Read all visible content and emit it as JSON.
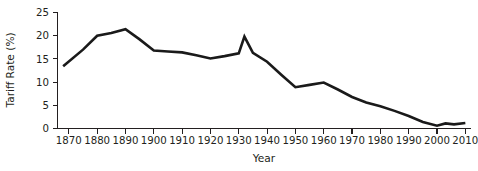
{
  "chart_data": {
    "type": "line",
    "title": "",
    "xlabel": "Year",
    "ylabel": "Tariff Rate (%)",
    "xlim": [
      1866,
      2012
    ],
    "ylim": [
      0,
      25
    ],
    "grid": false,
    "legend": false,
    "legend_position": "none",
    "line_color": "#1a1a1a",
    "line_width": 2.6,
    "x_tick_labels": [
      "1870",
      "1880",
      "1890",
      "1900",
      "1910",
      "1920",
      "1930",
      "1940",
      "1950",
      "1960",
      "1970",
      "1980",
      "1990",
      "2000",
      "2010"
    ],
    "x_ticks": [
      1870,
      1880,
      1890,
      1900,
      1910,
      1920,
      1930,
      1940,
      1950,
      1960,
      1970,
      1980,
      1990,
      2000,
      2010
    ],
    "y_tick_labels": [
      "0",
      "5",
      "10",
      "15",
      "20",
      "25"
    ],
    "y_ticks": [
      0,
      5,
      10,
      15,
      20,
      25
    ],
    "series": [
      {
        "name": "Average U.S. Tariff Rate",
        "x": [
          1868,
          1875,
          1880,
          1885,
          1890,
          1895,
          1900,
          1905,
          1910,
          1915,
          1920,
          1925,
          1930,
          1932,
          1935,
          1940,
          1945,
          1950,
          1955,
          1960,
          1965,
          1970,
          1975,
          1980,
          1985,
          1990,
          1995,
          2000,
          2003,
          2006,
          2010
        ],
        "values": [
          13.4,
          17.0,
          20.0,
          20.6,
          21.4,
          19.2,
          16.8,
          16.6,
          16.4,
          15.8,
          15.1,
          15.6,
          16.2,
          19.8,
          16.3,
          14.4,
          11.6,
          8.9,
          9.4,
          9.9,
          8.4,
          6.8,
          5.6,
          4.8,
          3.8,
          2.7,
          1.4,
          0.6,
          1.1,
          0.9,
          1.2
        ]
      }
    ]
  },
  "axes": {
    "ylabel": "Tariff Rate (%)",
    "xlabel": "Year"
  }
}
